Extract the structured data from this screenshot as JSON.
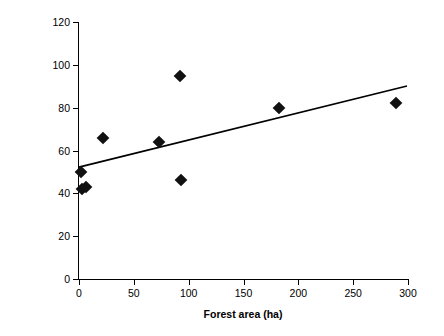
{
  "chart_data": {
    "type": "scatter",
    "title": "",
    "xlabel": "Forest area (ha)",
    "ylabel": "Species richness of woody plant feeding monts (# / stand)",
    "xlim": [
      0,
      300
    ],
    "ylim": [
      0,
      120
    ],
    "xticks": [
      0,
      50,
      100,
      150,
      200,
      250,
      300
    ],
    "yticks": [
      0,
      20,
      40,
      60,
      80,
      100,
      120
    ],
    "grid": false,
    "legend": false,
    "points": [
      {
        "x": 2,
        "y": 50
      },
      {
        "x": 3,
        "y": 42
      },
      {
        "x": 6,
        "y": 43
      },
      {
        "x": 22,
        "y": 66
      },
      {
        "x": 73,
        "y": 64
      },
      {
        "x": 92,
        "y": 95
      },
      {
        "x": 93,
        "y": 46
      },
      {
        "x": 182,
        "y": 80
      },
      {
        "x": 289,
        "y": 82
      }
    ],
    "trendline": {
      "x_start": 0,
      "y_start": 52,
      "x_end": 300,
      "y_end": 90
    }
  }
}
